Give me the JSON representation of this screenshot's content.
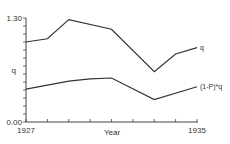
{
  "chart_data": {
    "type": "line",
    "title": "",
    "xlabel": "Year",
    "ylabel": "q",
    "xlim": [
      1927,
      1935
    ],
    "ylim": [
      0.0,
      1.3
    ],
    "grid": false,
    "x_tick_labels": [
      "1927",
      "1935"
    ],
    "y_tick_labels": [
      "0.00",
      "q",
      "1.30"
    ],
    "series": [
      {
        "name": "q",
        "label": "q",
        "x": [
          1927,
          1928,
          1929,
          1931,
          1933,
          1934,
          1935
        ],
        "values": [
          1.0,
          1.04,
          1.28,
          1.16,
          0.63,
          0.85,
          0.93
        ]
      },
      {
        "name": "(1-P)*q",
        "label": "(1-P)*q",
        "x": [
          1927,
          1928,
          1929,
          1930,
          1931,
          1933,
          1935
        ],
        "values": [
          0.41,
          0.46,
          0.51,
          0.54,
          0.55,
          0.28,
          0.44
        ]
      }
    ],
    "legend": "inline labels at right end of lines"
  },
  "axes": {
    "y_top": "1.30",
    "y_mid": "q",
    "y_bottom": "0.00",
    "x_left": "1927",
    "x_center": "Year",
    "x_right": "1935"
  },
  "labels": {
    "upper": "q",
    "lower": "(1-P)*q"
  },
  "colors": {
    "line": "#333333",
    "axis": "#444444",
    "background": "#ffffff"
  }
}
